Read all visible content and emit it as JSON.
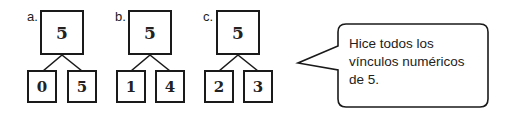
{
  "bonds": [
    {
      "label": "a.",
      "whole": "5",
      "parts": [
        "0",
        "5"
      ]
    },
    {
      "label": "b.",
      "whole": "5",
      "parts": [
        "1",
        "4"
      ]
    },
    {
      "label": "c.",
      "whole": "5",
      "parts": [
        "2",
        "3"
      ]
    }
  ],
  "speech_bubble": {
    "lines": [
      "Hice todos los",
      "vínculos numéricos",
      "de 5."
    ]
  }
}
